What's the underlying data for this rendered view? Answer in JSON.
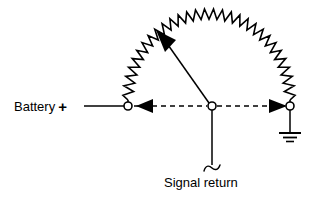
{
  "diagram": {
    "type": "electrical-schematic",
    "colors": {
      "stroke": "#000000",
      "background": "#ffffff",
      "text": "#000000"
    },
    "labels": {
      "battery": "Battery",
      "battery_polarity": "+",
      "signal_return": "Signal return"
    },
    "nodes": [
      {
        "name": "battery-positive-node",
        "x": 128,
        "y": 106,
        "radius": 4,
        "style": "open-circle"
      },
      {
        "name": "signal-return-node",
        "x": 212,
        "y": 106,
        "radius": 4,
        "style": "open-circle"
      },
      {
        "name": "ground-node",
        "x": 290,
        "y": 106,
        "radius": 4,
        "style": "open-circle"
      }
    ],
    "wires": [
      {
        "name": "battery-lead",
        "from_x": 84,
        "from_y": 106,
        "to_x": 124,
        "to_y": 106,
        "style": "solid"
      },
      {
        "name": "return-path-left",
        "from_x": 133,
        "from_y": 106,
        "to_x": 208,
        "to_y": 106,
        "style": "dashed"
      },
      {
        "name": "return-path-right",
        "from_x": 216,
        "from_y": 106,
        "to_x": 286,
        "to_y": 106,
        "style": "dashed"
      },
      {
        "name": "signal-return-drop",
        "from_x": 212,
        "from_y": 110,
        "to_x": 212,
        "to_y": 166,
        "style": "solid"
      },
      {
        "name": "ground-drop",
        "from_x": 290,
        "from_y": 110,
        "to_x": 290,
        "to_y": 133,
        "style": "solid"
      },
      {
        "name": "zigzag-arc",
        "style": "zigzag-semicircle",
        "start_x": 128,
        "start_y": 100,
        "end_x": 290,
        "end_y": 100,
        "peak_y": 14,
        "teeth": 30
      },
      {
        "name": "current-arrow-diagonal",
        "from_x": 208,
        "from_y": 102,
        "to_x": 158,
        "to_y": 32,
        "style": "solid-with-arrowhead"
      }
    ],
    "arrows": [
      {
        "name": "current-arrow-left",
        "direction": "left",
        "tip_x": 139,
        "tip_y": 106
      },
      {
        "name": "current-arrow-right",
        "direction": "right",
        "tip_x": 284,
        "tip_y": 106
      },
      {
        "name": "current-arrow-up-left",
        "direction": "up-left",
        "tip_x": 156,
        "tip_y": 30
      }
    ],
    "ground_symbol": {
      "name": "earth-ground-symbol",
      "center_x": 290,
      "bars": [
        {
          "y": 133,
          "half_width": 11
        },
        {
          "y": 137,
          "half_width": 7
        },
        {
          "y": 141,
          "half_width": 3
        }
      ]
    },
    "break_mark": {
      "name": "wire-break-squiggle",
      "x": 212,
      "y": 168
    }
  }
}
